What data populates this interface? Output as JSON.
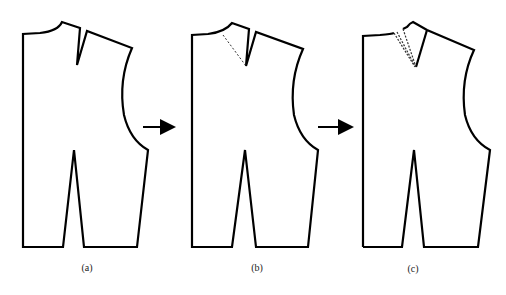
{
  "figure": {
    "panels": [
      {
        "id": "a",
        "caption": "(a)"
      },
      {
        "id": "b",
        "caption": "(b)"
      },
      {
        "id": "c",
        "caption": "(c)"
      }
    ],
    "arrows": [
      "arrow-a-to-b",
      "arrow-b-to-c"
    ],
    "colors": {
      "line": "#000000",
      "background": "#ffffff",
      "dashed": "#333333"
    }
  }
}
